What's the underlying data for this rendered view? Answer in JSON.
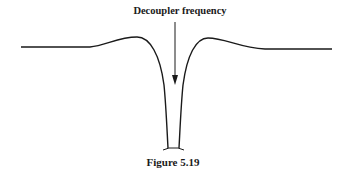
{
  "figure": {
    "annotation": "Decoupler frequency",
    "caption": "Figure 5.19",
    "line_color": "#1a1a1a"
  }
}
